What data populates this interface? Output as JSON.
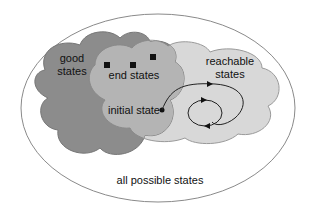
{
  "diagram": {
    "labels": {
      "good_states": [
        "good",
        "states"
      ],
      "end_states": "end states",
      "reachable_states": [
        "reachable",
        "states"
      ],
      "initial_state": "initial state",
      "all_possible_states": "all possible states"
    },
    "colors": {
      "outer_fill": "#ffffff",
      "outer_stroke": "#8a8a8a",
      "good_fill": "#8c8c8c",
      "reachable_fill": "#d8d8d8",
      "intersection_fill": "#b4b4b4",
      "marker": "#111111"
    },
    "end_state_count": 3
  }
}
